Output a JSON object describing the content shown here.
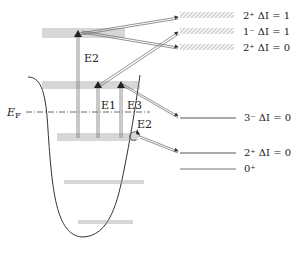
{
  "diagram": {
    "type": "nuclear-energy-level-diagram",
    "fermi_label": "E",
    "fermi_sub": "F",
    "transition_labels": {
      "e2_upper": "E2",
      "e1": "E1",
      "e3": "E3",
      "e2_lower": "E2"
    },
    "upper_states": [
      {
        "jpi": "2⁺",
        "delta": "ΔI = 1"
      },
      {
        "jpi": "1⁻",
        "delta": "ΔI = 1"
      },
      {
        "jpi": "2⁺",
        "delta": "ΔI = 0"
      }
    ],
    "lower_states": [
      {
        "jpi": "3⁻",
        "delta": "ΔI = 0"
      },
      {
        "jpi": "2⁺",
        "delta": "ΔI = 0"
      },
      {
        "jpi": "0⁺",
        "delta": ""
      }
    ],
    "colors": {
      "line": "#333333",
      "level": "#888888",
      "arrow": "#444444",
      "hatch": "#999999"
    }
  }
}
